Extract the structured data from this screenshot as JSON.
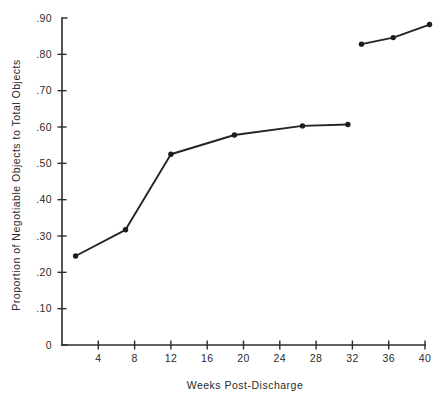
{
  "chart_data": {
    "type": "line",
    "title": "",
    "xlabel": "Weeks Post-Discharge",
    "ylabel": "Proportion of Negotiable Objects to Total Objects",
    "xlim": [
      0,
      42
    ],
    "ylim": [
      0,
      0.9
    ],
    "grid": false,
    "legend": "none",
    "xticks": [
      4,
      8,
      12,
      16,
      20,
      24,
      28,
      32,
      36,
      40
    ],
    "xtick_labels": [
      "4",
      "8",
      "12",
      "16",
      "20",
      "24",
      "28",
      "32",
      "36",
      "40"
    ],
    "yticks": [
      0,
      0.1,
      0.2,
      0.3,
      0.4,
      0.5,
      0.6,
      0.7,
      0.8,
      0.9
    ],
    "ytick_labels": [
      "0",
      ".10",
      ".20",
      ".30",
      ".40",
      ".50",
      ".60",
      ".70",
      ".80",
      ".90"
    ],
    "series": [
      {
        "name": "segment-1",
        "x": [
          1.5,
          7.0,
          12.0,
          19.0,
          26.5,
          31.5
        ],
        "values": [
          0.245,
          0.317,
          0.525,
          0.578,
          0.603,
          0.607
        ]
      },
      {
        "name": "segment-2",
        "x": [
          33.0,
          36.5,
          40.5
        ],
        "values": [
          0.828,
          0.846,
          0.882
        ]
      }
    ],
    "colors": {
      "line": "#242424",
      "marker": "#1c1c1c",
      "axis": "#2b2b2b",
      "background": "#ffffff"
    }
  }
}
